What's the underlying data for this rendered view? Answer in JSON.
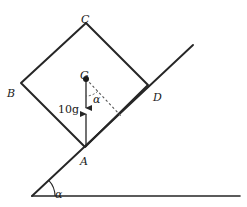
{
  "figure": {
    "stroke_color": "#262626",
    "dashed_color": "#555555",
    "background": "#ffffff"
  },
  "vertices": {
    "A": {
      "label": "A",
      "x": 85,
      "y": 147,
      "label_x": 80,
      "label_y": 156
    },
    "B": {
      "label": "B",
      "x": 21,
      "y": 83,
      "label_x": 7,
      "label_y": 88
    },
    "C": {
      "label": "C",
      "x": 86,
      "y": 23,
      "label_x": 81,
      "label_y": 14
    },
    "D": {
      "label": "D",
      "x": 148,
      "y": 85,
      "label_x": 153,
      "label_y": 92
    }
  },
  "centre_of_mass": {
    "label": "G",
    "x": 86,
    "y": 79,
    "label_x": 80,
    "label_y": 70
  },
  "forces": {
    "weight": {
      "label": "10g",
      "label_x": 58,
      "label_y": 104,
      "from_x": 86,
      "from_y": 79,
      "to_x": 86,
      "to_y": 108,
      "direction": "down"
    },
    "reaction": {
      "label": "",
      "from_x": 86,
      "from_y": 147,
      "to_x": 86,
      "to_y": 114,
      "direction": "up"
    }
  },
  "angles": {
    "at_vertical": {
      "label": "α",
      "label_x": 93,
      "label_y": 94
    },
    "at_base": {
      "label": "α",
      "label_x": 55,
      "label_y": 189
    }
  },
  "incline": {
    "base_x": 32,
    "base_y": 196,
    "top_x": 193,
    "top_y": 45
  },
  "ground": {
    "from_x": 32,
    "from_y": 196,
    "to_x": 240,
    "to_y": 196
  },
  "normal_dashed": {
    "from_x": 86,
    "from_y": 79,
    "to_x": 122,
    "to_y": 117
  }
}
